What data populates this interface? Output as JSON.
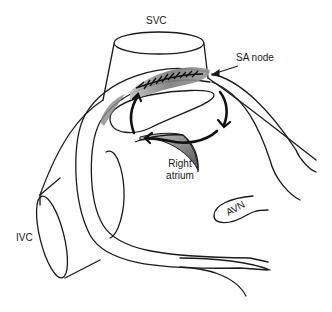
{
  "figure": {
    "type": "anatomical-diagram",
    "colors": {
      "line": "#1a1a1a",
      "shading": "#8a8a8a",
      "background": "#ffffff"
    }
  },
  "labels": {
    "svc": "SVC",
    "sa_node": "SA node",
    "right_atrium_line1": "Right",
    "right_atrium_line2": "atrium",
    "ivc": "IVC",
    "avn": "AVN"
  }
}
